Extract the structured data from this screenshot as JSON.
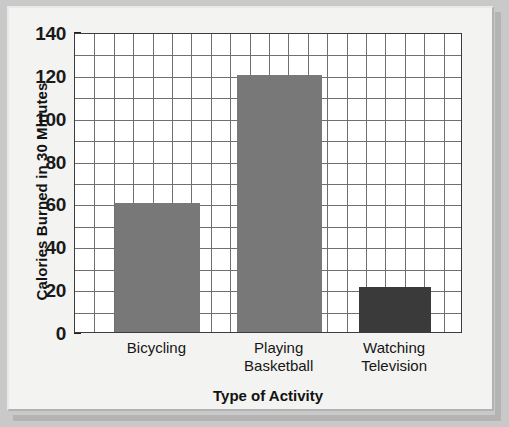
{
  "chart_data": {
    "type": "bar",
    "title": "",
    "subtitle": "",
    "xlabel": "Type of Activity",
    "ylabel": "Calories Burned in 30 Minutes",
    "categories": [
      "Bicycling",
      "Playing Basketball",
      "Watching Television"
    ],
    "category_lines": [
      [
        "Bicycling"
      ],
      [
        "Playing",
        "Basketball"
      ],
      [
        "Watching",
        "Television"
      ]
    ],
    "values": [
      60,
      120,
      21
    ],
    "ylim": [
      0,
      140
    ],
    "ytick_labels": [
      "0",
      "20",
      "40",
      "60",
      "80",
      "100",
      "120",
      "140"
    ],
    "ytick_values": [
      0,
      20,
      40,
      60,
      80,
      100,
      120,
      140
    ],
    "ytick_step": 20,
    "minor_gridline_step": 10,
    "grid": true,
    "grid_columns": 20,
    "grid_rows": 14,
    "legend": "none",
    "bar_colors": [
      "#787878",
      "#787878",
      "#3a3a3a"
    ],
    "series": [
      {
        "name": "Calories Burned in 30 Minutes",
        "values": [
          60,
          120,
          21
        ]
      }
    ]
  },
  "figure": {
    "plot_background": "#ffffff",
    "frame_background": "#f3f3f1",
    "frame_border": "#c9c9c9",
    "axis_color": "#3d3d3d",
    "gridline_color": "#6f6f6f",
    "text_color": "#161616"
  }
}
